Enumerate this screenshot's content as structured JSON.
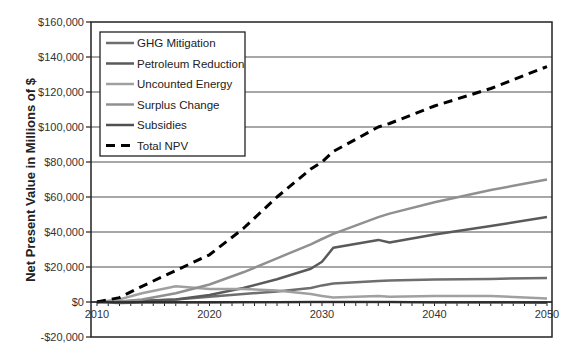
{
  "chart_data": {
    "type": "line",
    "title": "",
    "xlabel": "",
    "ylabel": "Net Present Value in Millions of $",
    "xlim": [
      2010,
      2050
    ],
    "ylim": [
      -20000,
      160000
    ],
    "x_ticks": [
      "2010",
      "2020",
      "2030",
      "2040",
      "2050"
    ],
    "y_ticks": [
      "$160,000",
      "$140,000",
      "$120,000",
      "$100,000",
      "$80,000",
      "$60,000",
      "$40,000",
      "$20,000",
      "$0",
      "-$20,000"
    ],
    "grid": true,
    "legend_position": "upper-left",
    "x": [
      2010,
      2012,
      2014,
      2017,
      2020,
      2023,
      2026,
      2029,
      2030,
      2031,
      2035,
      2036,
      2040,
      2045,
      2050
    ],
    "series": [
      {
        "name": "GHG Mitigation",
        "color": "#6e6e6e",
        "width": 2.5,
        "dash": "",
        "values": [
          0,
          300,
          700,
          1500,
          3000,
          4500,
          6000,
          8000,
          9500,
          10500,
          12000,
          12200,
          12800,
          13200,
          13800
        ]
      },
      {
        "name": "Petroleum Reduction",
        "color": "#5a5a5a",
        "width": 2.5,
        "dash": "",
        "values": [
          0,
          200,
          500,
          1500,
          4000,
          8000,
          13000,
          19000,
          23000,
          31000,
          35500,
          34000,
          38500,
          43500,
          48500
        ]
      },
      {
        "name": "Uncounted Energy",
        "color": "#a0a0a0",
        "width": 2.5,
        "dash": "",
        "values": [
          0,
          1500,
          5000,
          9000,
          7500,
          7500,
          6500,
          4500,
          3500,
          2500,
          3500,
          3000,
          3500,
          3500,
          2000
        ]
      },
      {
        "name": "Surplus Change",
        "color": "#909090",
        "width": 2.5,
        "dash": "",
        "values": [
          0,
          300,
          1500,
          5000,
          10000,
          17000,
          25000,
          33000,
          36000,
          39000,
          48500,
          50500,
          57000,
          64000,
          70000
        ]
      },
      {
        "name": "Subsidies",
        "color": "#505050",
        "width": 2.5,
        "dash": "",
        "values": [
          0,
          -500,
          -300,
          -200,
          -200,
          -100,
          -100,
          0,
          0,
          0,
          0,
          0,
          -200,
          -300,
          -400
        ]
      },
      {
        "name": "Total NPV",
        "color": "#000000",
        "width": 3,
        "dash": "9,6",
        "values": [
          0,
          2500,
          9000,
          18000,
          27000,
          42000,
          60000,
          76000,
          80000,
          86000,
          100000,
          102000,
          112000,
          122000,
          134500
        ]
      }
    ]
  },
  "legend": {
    "items": [
      {
        "label": "GHG Mitigation"
      },
      {
        "label": "Petroleum Reduction"
      },
      {
        "label": "Uncounted Energy"
      },
      {
        "label": "Surplus Change"
      },
      {
        "label": "Subsidies"
      },
      {
        "label": "Total NPV"
      }
    ]
  },
  "axes": {
    "ylabel": "Net Present Value in Millions of $"
  }
}
